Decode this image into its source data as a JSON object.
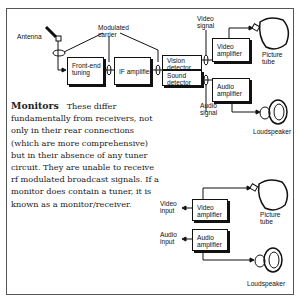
{
  "diagram_top": {
    "antenna_label": "Antenna",
    "modulated_carrier_label": "Modulated\ncarrier",
    "front_end_tuning": "Front-end\ntuning",
    "if_amplifier": "IF amplifier",
    "vision_detector": "Vision\ndetector",
    "sound_detector": "Sound\ndetector",
    "video_signal_label": "Video\nsignal",
    "audio_signal_label": "Audio\nsignal",
    "video_amplifier": "Video\namplifier",
    "audio_amplifier": "Audio\namplifier",
    "picture_tube_label": "Picture\ntube",
    "loudspeaker_label": "Loudspeaker"
  },
  "text": {
    "heading": "Monitors",
    "body": "These differ fundamentally from receivers, not only in their rear connections (which are more comprehensive) but in their absence of any tuner circuit. They are unable to receive rf modulated broadcast signals. If a monitor does contain a tuner, it is known as a monitor/receiver."
  },
  "diagram_bottom": {
    "video_input_label": "Video\ninput",
    "audio_input_label": "Audio\ninput",
    "video_amplifier": "Video\namplifier",
    "audio_amplifier": "Audio\namplifier",
    "picture_tube_label": "Picture\ntube",
    "loudspeaker_label": "Loudspeaker"
  }
}
